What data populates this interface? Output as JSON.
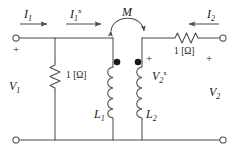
{
  "diagram": {
    "type": "circuit-schematic",
    "line_color": "#4d4d4d",
    "text_color": "#1a1a1a",
    "background": "#ffffff"
  },
  "labels": {
    "current_input": {
      "symbol": "I",
      "subscript": "1",
      "superscript": "",
      "direction": "right"
    },
    "current_mid": {
      "symbol": "I",
      "subscript": "1",
      "superscript": "x",
      "direction": "right"
    },
    "mutual_inductance": {
      "symbol": "M",
      "subscript": "",
      "superscript": ""
    },
    "current_output": {
      "symbol": "I",
      "subscript": "2",
      "superscript": "",
      "direction": "left"
    },
    "voltage_input": {
      "symbol": "V",
      "subscript": "1",
      "superscript": ""
    },
    "voltage_mid": {
      "symbol": "V",
      "subscript": "2",
      "superscript": "x"
    },
    "voltage_output": {
      "symbol": "V",
      "subscript": "2",
      "superscript": ""
    },
    "inductor_primary": {
      "symbol": "L",
      "subscript": "1",
      "superscript": ""
    },
    "inductor_secondary": {
      "symbol": "L",
      "subscript": "2",
      "superscript": ""
    }
  },
  "components": {
    "shunt_resistor": {
      "value": "1 [Ω]"
    },
    "series_resistor": {
      "value": "1 [Ω]"
    }
  },
  "polarity_marks": {
    "left_plus": "+",
    "mid_plus": "+",
    "right_plus": "+"
  }
}
